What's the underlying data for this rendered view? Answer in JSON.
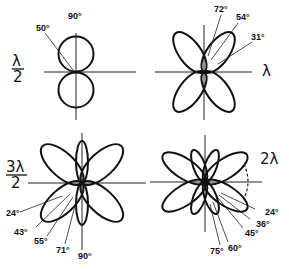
{
  "figure": {
    "panels": [
      {
        "id": "half-wave",
        "length_label": {
          "numerator": "λ",
          "denominator": "2"
        },
        "lobe_angles": [
          {
            "label": "90°"
          },
          {
            "label": "50°"
          }
        ]
      },
      {
        "id": "full-wave",
        "length_label": {
          "text": "λ"
        },
        "lobe_angles": [
          {
            "label": "72°"
          },
          {
            "label": "54°"
          },
          {
            "label": "31°"
          }
        ]
      },
      {
        "id": "three-half-wave",
        "length_label": {
          "numerator": "3λ",
          "denominator": "2"
        },
        "lobe_angles": [
          {
            "label": "24°"
          },
          {
            "label": "43°"
          },
          {
            "label": "55°"
          },
          {
            "label": "71°"
          },
          {
            "label": "90°"
          }
        ]
      },
      {
        "id": "two-wave",
        "length_label": {
          "text": "2λ"
        },
        "lobe_angles": [
          {
            "label": "24°"
          },
          {
            "label": "36°"
          },
          {
            "label": "45°"
          },
          {
            "label": "60°"
          },
          {
            "label": "75°"
          }
        ]
      }
    ]
  }
}
